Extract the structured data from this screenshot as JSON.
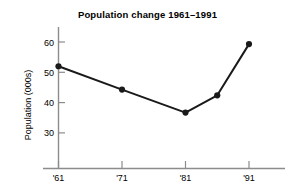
{
  "chart_data": {
    "type": "line",
    "title": "Population change 1961–1991",
    "xlabel": "",
    "ylabel": "Population (000s)",
    "x": [
      "'61",
      "'71",
      "'81",
      "'86",
      "'91"
    ],
    "x_tick_labels": [
      "'61",
      "'71",
      "'81",
      "'91"
    ],
    "x_tick_values": [
      1961,
      1971,
      1981,
      1991
    ],
    "xlim": [
      1961,
      1995
    ],
    "values": [
      52.0,
      44.3,
      36.7,
      42.4,
      59.3
    ],
    "points": [
      {
        "x": "'61",
        "year": 1961,
        "value": 52.0
      },
      {
        "x": "'71",
        "year": 1971,
        "value": 44.3
      },
      {
        "x": "'81",
        "year": 1981,
        "value": 36.7
      },
      {
        "x": "'86",
        "year": 1986,
        "value": 42.4
      },
      {
        "x": "'91",
        "year": 1991,
        "value": 59.3
      }
    ],
    "y_tick_labels": [
      "30",
      "40",
      "50",
      "60"
    ],
    "y_tick_values": [
      30,
      40,
      50,
      60
    ],
    "ylim": [
      24,
      64
    ],
    "grid": false,
    "legend": null,
    "legend_position": "none",
    "marker": "filled-circle",
    "line_color": "#1a1a1a",
    "marker_color": "#1a1a1a",
    "axis_color": "#8c8c8c",
    "background_color": "#ffffff"
  },
  "axis": {
    "y_label": "Population (000s)",
    "y_ticks": [
      "60",
      "50",
      "40",
      "30"
    ],
    "x_ticks": [
      "'61",
      "'71",
      "'81",
      "'91"
    ]
  },
  "title": {
    "text": "Population change 1961–1991"
  }
}
